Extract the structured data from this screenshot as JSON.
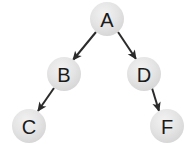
{
  "diagram": {
    "type": "binary-tree",
    "canvas": {
      "width": 195,
      "height": 154,
      "background": "#ffffff"
    },
    "style": {
      "node_fill": "#e2e2e2",
      "node_highlight": "#efefef",
      "node_shadow": "#cfcfcf",
      "label_color": "#1a1a1a",
      "edge_color": "#2b2b2b",
      "node_radius": 17
    },
    "nodes": [
      {
        "id": "A",
        "label": "A",
        "cx": 107,
        "cy": 19,
        "r": 17
      },
      {
        "id": "B",
        "label": "B",
        "cx": 64,
        "cy": 74,
        "r": 17
      },
      {
        "id": "D",
        "label": "D",
        "cx": 144,
        "cy": 74,
        "r": 17
      },
      {
        "id": "C",
        "label": "C",
        "cx": 29,
        "cy": 126,
        "r": 17
      },
      {
        "id": "F",
        "label": "F",
        "cx": 167,
        "cy": 126,
        "r": 17
      }
    ],
    "edges": [
      {
        "id": "A-B",
        "from": "A",
        "to": "B",
        "x1": 96,
        "y1": 32,
        "x2": 73,
        "y2": 60,
        "directed": true
      },
      {
        "id": "A-D",
        "from": "A",
        "to": "D",
        "x1": 118,
        "y1": 32,
        "x2": 136,
        "y2": 59,
        "directed": true
      },
      {
        "id": "B-C",
        "from": "B",
        "to": "C",
        "x1": 54,
        "y1": 88,
        "x2": 38,
        "y2": 111,
        "directed": true
      },
      {
        "id": "D-F",
        "from": "D",
        "to": "F",
        "x1": 152,
        "y1": 88,
        "x2": 159,
        "y2": 111,
        "directed": true
      }
    ]
  }
}
